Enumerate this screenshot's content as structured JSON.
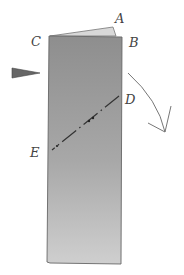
{
  "diagram": {
    "type": "paper-folding-step",
    "labels": {
      "A": "A",
      "B": "B",
      "C": "C",
      "D": "D",
      "E": "E"
    },
    "colors": {
      "paper": "#9a9a9a",
      "paper_light": "#c8c8c8",
      "flap": "#d8d8d8",
      "stroke": "#555555",
      "ink": "#444444"
    }
  }
}
